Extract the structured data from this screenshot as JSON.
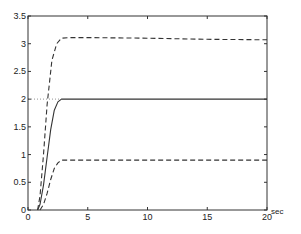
{
  "chart_data": {
    "type": "line",
    "title": "",
    "xlabel": "sec",
    "ylabel": "",
    "xlim": [
      0,
      20
    ],
    "ylim": [
      0,
      3.5
    ],
    "grid": false,
    "legend": null,
    "x_ticks": [
      0,
      5,
      10,
      15,
      20
    ],
    "y_ticks": [
      0,
      0.5,
      1,
      1.5,
      2,
      2.5,
      3,
      3.5
    ],
    "x_tick_labels": [
      "0",
      "5",
      "10",
      "15",
      "20"
    ],
    "y_tick_labels": [
      "0",
      "0.5",
      "1",
      "1.5",
      "2",
      "2.5",
      "3",
      "3.5"
    ],
    "series": [
      {
        "name": "upper bound (dashed)",
        "style": "dashed",
        "x": [
          0.8,
          1.0,
          1.3,
          1.6,
          2.0,
          2.4,
          2.8,
          3.5,
          5,
          10,
          15,
          20
        ],
        "y": [
          0,
          0.25,
          1.0,
          1.9,
          2.7,
          3.0,
          3.1,
          3.11,
          3.11,
          3.1,
          3.08,
          3.07
        ]
      },
      {
        "name": "response (solid)",
        "style": "solid",
        "x": [
          0.8,
          1.0,
          1.3,
          1.6,
          1.9,
          2.2,
          2.5,
          2.8,
          3.2,
          5,
          10,
          15,
          20
        ],
        "y": [
          0,
          0.1,
          0.45,
          0.95,
          1.45,
          1.8,
          1.95,
          2.0,
          2.0,
          2.0,
          2.0,
          2.0,
          2.0
        ]
      },
      {
        "name": "lower bound (dashed)",
        "style": "dashed",
        "x": [
          1.0,
          1.3,
          1.6,
          1.9,
          2.2,
          2.5,
          2.8,
          3.2,
          5,
          10,
          15,
          20
        ],
        "y": [
          0,
          0.1,
          0.3,
          0.55,
          0.75,
          0.85,
          0.9,
          0.9,
          0.9,
          0.9,
          0.9,
          0.9
        ]
      },
      {
        "name": "setpoint (dotted)",
        "style": "dotted",
        "x": [
          0,
          2.8
        ],
        "y": [
          2.0,
          2.0
        ]
      }
    ],
    "annotations": [
      {
        "text": "sec",
        "position": "right of x-axis end"
      }
    ]
  }
}
